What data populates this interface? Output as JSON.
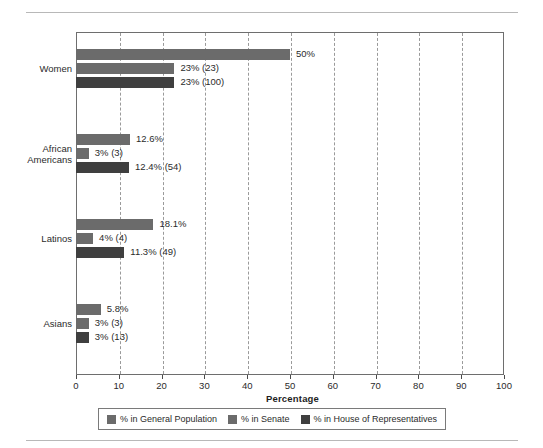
{
  "figure": {
    "rules": [
      "top-rule",
      "bottom-rule"
    ]
  },
  "axis": {
    "x_title": "Percentage",
    "ticks": [
      "0",
      "10",
      "20",
      "30",
      "40",
      "50",
      "60",
      "70",
      "80",
      "90",
      "100"
    ]
  },
  "categories": [
    {
      "label_line1": "Women",
      "label_line2": ""
    },
    {
      "label_line1": "African",
      "label_line2": "Americans"
    },
    {
      "label_line1": "Latinos",
      "label_line2": ""
    },
    {
      "label_line1": "Asians",
      "label_line2": ""
    }
  ],
  "legend": {
    "items": [
      {
        "label": "% in General Population",
        "color": "#6b6b6b"
      },
      {
        "label": "% in Senate",
        "color": "#6b6b6b"
      },
      {
        "label": "% in House of Representatives",
        "color": "#3f3f3f"
      }
    ]
  },
  "chart_data": {
    "type": "bar",
    "orientation": "horizontal",
    "title": "",
    "xlabel": "Percentage",
    "ylabel": "",
    "xlim": [
      0,
      100
    ],
    "xticks": [
      0,
      10,
      20,
      30,
      40,
      50,
      60,
      70,
      80,
      90,
      100
    ],
    "grid": "vertical-dashed",
    "legend_position": "bottom",
    "categories": [
      "Women",
      "African Americans",
      "Latinos",
      "Asians"
    ],
    "series": [
      {
        "name": "% in General Population",
        "color": "#6b6b6b",
        "values": [
          50,
          12.6,
          18.1,
          5.8
        ],
        "labels": [
          "50%",
          "12.6%",
          "18.1%",
          "5.8%"
        ]
      },
      {
        "name": "% in Senate",
        "color": "#6b6b6b",
        "values": [
          23,
          3,
          4,
          3
        ],
        "labels": [
          "23% (23)",
          "3% (3)",
          "4% (4)",
          "3% (3)"
        ]
      },
      {
        "name": "% in House of Representatives",
        "color": "#3f3f3f",
        "values": [
          23,
          12.4,
          11.3,
          3
        ],
        "labels": [
          "23% (100)",
          "12.4% (54)",
          "11.3% (49)",
          "3% (13)"
        ]
      }
    ]
  }
}
